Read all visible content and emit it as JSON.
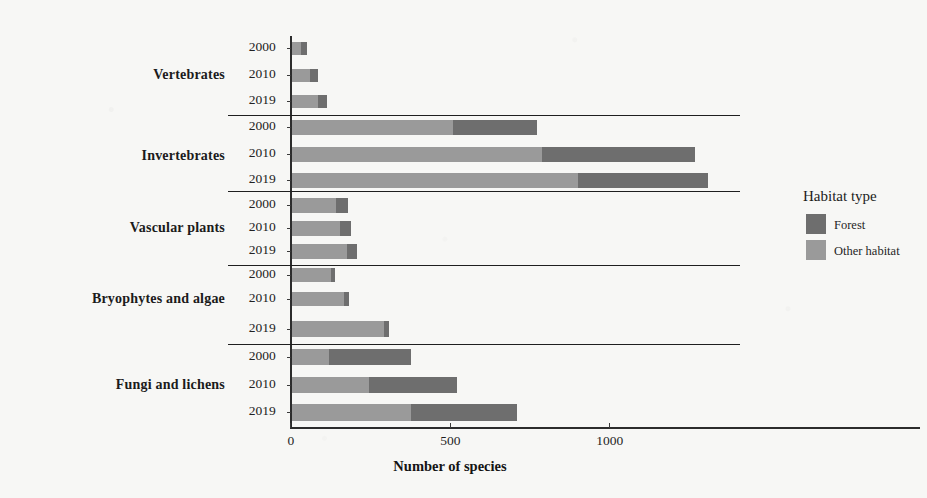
{
  "chart_data": {
    "type": "bar",
    "orientation": "horizontal",
    "stacked": true,
    "title": "",
    "xlabel": "Number of species",
    "ylabel": "",
    "xlim": [
      0,
      1400
    ],
    "xticks": [
      0,
      500,
      1000
    ],
    "xtick_labels": [
      "0",
      "500",
      "1000"
    ],
    "grid": false,
    "legend": {
      "title": "Habitat type",
      "position": "right",
      "entries": [
        {
          "name": "Forest",
          "color": "#6e6e6e"
        },
        {
          "name": "Other habitat",
          "color": "#9a9a9a"
        }
      ]
    },
    "series": [
      {
        "name": "Other habitat",
        "color": "#9a9a9a"
      },
      {
        "name": "Forest",
        "color": "#6e6e6e"
      }
    ],
    "panels": [
      {
        "category": "Vertebrates",
        "rows": [
          {
            "year": "2000",
            "other_habitat": 28,
            "forest": 19,
            "total": 47
          },
          {
            "year": "2010",
            "other_habitat": 57,
            "forest": 25,
            "total": 82
          },
          {
            "year": "2019",
            "other_habitat": 82,
            "forest": 28,
            "total": 110
          }
        ]
      },
      {
        "category": "Invertebrates",
        "rows": [
          {
            "year": "2000",
            "other_habitat": 505,
            "forest": 263,
            "total": 768
          },
          {
            "year": "2010",
            "other_habitat": 784,
            "forest": 479,
            "total": 1263
          },
          {
            "year": "2019",
            "other_habitat": 897,
            "forest": 407,
            "total": 1304
          }
        ]
      },
      {
        "category": "Vascular plants",
        "rows": [
          {
            "year": "2000",
            "other_habitat": 140,
            "forest": 36,
            "total": 176
          },
          {
            "year": "2010",
            "other_habitat": 150,
            "forest": 35,
            "total": 185
          },
          {
            "year": "2019",
            "other_habitat": 172,
            "forest": 32,
            "total": 204
          }
        ]
      },
      {
        "category": "Bryophytes and algae",
        "rows": [
          {
            "year": "2000",
            "other_habitat": 122,
            "forest": 13,
            "total": 135
          },
          {
            "year": "2010",
            "other_habitat": 163,
            "forest": 16,
            "total": 179
          },
          {
            "year": "2019",
            "other_habitat": 288,
            "forest": 16,
            "total": 304
          }
        ]
      },
      {
        "category": "Fungi and lichens",
        "rows": [
          {
            "year": "2000",
            "other_habitat": 117,
            "forest": 257,
            "total": 374
          },
          {
            "year": "2010",
            "other_habitat": 242,
            "forest": 276,
            "total": 518
          },
          {
            "year": "2019",
            "other_habitat": 374,
            "forest": 333,
            "total": 707
          }
        ]
      }
    ]
  },
  "colors": {
    "forest": "#6e6e6e",
    "other_habitat": "#9a9a9a",
    "axis": "#2c2c2c",
    "background": "#f7f7f5",
    "text": "#1b1b1b"
  }
}
